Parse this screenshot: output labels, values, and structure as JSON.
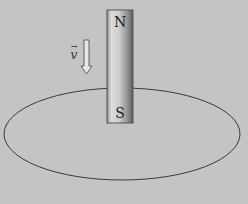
{
  "diagram": {
    "magnet": {
      "north_label": "N",
      "south_label": "S"
    },
    "velocity_label": "v",
    "velocity_arrow_symbol": "→",
    "colors": {
      "background": "#c4c4c4",
      "loop": "#3a3a3a",
      "magnet_light": "#e2e2e2",
      "magnet_dark": "#555555"
    }
  }
}
